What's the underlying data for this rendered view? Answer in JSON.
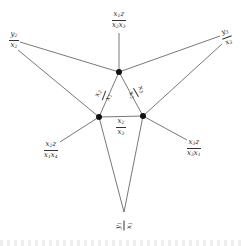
{
  "diagram": {
    "nodes": [
      {
        "id": "top",
        "x": 119,
        "y": 72
      },
      {
        "id": "left",
        "x": 99,
        "y": 117
      },
      {
        "id": "right",
        "x": 143,
        "y": 116
      }
    ],
    "edges": [
      [
        "top",
        "left"
      ],
      [
        "top",
        "right"
      ],
      [
        "left",
        "right"
      ]
    ],
    "labels": [
      {
        "id": "outer-top",
        "num": [
          "x",
          "1",
          "z",
          ""
        ],
        "den": [
          "x",
          "2",
          "x",
          "3"
        ],
        "x": 119,
        "y": 20,
        "rot": 0,
        "anchor": "top"
      },
      {
        "id": "outer-upper-left",
        "num": [
          "y",
          "2",
          "",
          ""
        ],
        "den": [
          "x",
          "2",
          "",
          ""
        ],
        "x": 14,
        "y": 40,
        "rot": 0,
        "anchor": "top"
      },
      {
        "id": "outer-upper-right",
        "num": [
          "y",
          "3",
          "",
          ""
        ],
        "den": [
          "x",
          "3",
          "",
          ""
        ],
        "x": 227,
        "y": 37,
        "rot": -20,
        "anchor": "top"
      },
      {
        "id": "outer-lower-left",
        "num": [
          "x",
          "2",
          "z",
          ""
        ],
        "den": [
          "x",
          "1",
          "x",
          "4"
        ],
        "x": 51,
        "y": 150,
        "rot": 0,
        "anchor": "left"
      },
      {
        "id": "outer-lower-right",
        "num": [
          "x",
          "3",
          "z",
          ""
        ],
        "den": [
          "x",
          "3",
          "x",
          "1"
        ],
        "x": 194,
        "y": 148,
        "rot": 0,
        "anchor": "right"
      },
      {
        "id": "outer-bottom",
        "num": [
          "y",
          "1",
          "",
          ""
        ],
        "den": [
          "x",
          "1",
          "",
          ""
        ],
        "x": 124,
        "y": 225,
        "rot": -90,
        "anchor": "left"
      },
      {
        "id": "inner-left",
        "num": [
          "x",
          "2",
          "",
          ""
        ],
        "den": [
          "x",
          "1",
          "",
          ""
        ],
        "x": 104,
        "y": 95,
        "rot": -70,
        "anchor": "inner"
      },
      {
        "id": "inner-right",
        "num": [
          "x",
          "3",
          "",
          ""
        ],
        "den": [
          "x",
          "2",
          "",
          ""
        ],
        "x": 136,
        "y": 92,
        "rot": 60,
        "anchor": "inner"
      },
      {
        "id": "inner-bottom",
        "num": [
          "x",
          "2",
          "",
          ""
        ],
        "den": [
          "x",
          "3",
          "",
          ""
        ],
        "x": 121,
        "y": 127,
        "rot": 0,
        "anchor": "inner"
      }
    ],
    "outer_edges": [
      {
        "from": "top",
        "label": "outer-top",
        "tx": 119,
        "ty": 33
      },
      {
        "from": "top",
        "label": "outer-upper-left",
        "tx": 20,
        "ty": 42
      },
      {
        "from": "top",
        "label": "outer-upper-right",
        "tx": 220,
        "ty": 36
      },
      {
        "from": "left",
        "label": "outer-upper-left",
        "tx": 18,
        "ty": 50
      },
      {
        "from": "right",
        "label": "outer-upper-right",
        "tx": 222,
        "ty": 44
      },
      {
        "from": "left",
        "label": "outer-lower-left",
        "tx": 60,
        "ty": 142
      },
      {
        "from": "right",
        "label": "outer-lower-right",
        "tx": 187,
        "ty": 140
      },
      {
        "from": "left",
        "label": "outer-bottom",
        "tx": 124,
        "ty": 212
      },
      {
        "from": "right",
        "label": "outer-bottom",
        "tx": 124,
        "ty": 212
      }
    ]
  }
}
